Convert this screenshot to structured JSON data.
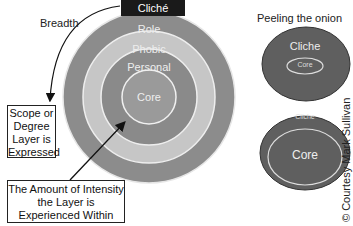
{
  "main_diagram": {
    "top_label": "Cliché",
    "breadth_label": "Breadth",
    "layers": [
      "Role",
      "Phobic",
      "Personal",
      "Core"
    ],
    "scope_box": [
      "Scope or",
      "Degree",
      "Layer is",
      "Expressed"
    ],
    "intensity_box": [
      "The Amount of Intensity",
      "the Layer is",
      "Experienced Within"
    ]
  },
  "onion": {
    "title": "Peeling the onion",
    "top": {
      "outer": "Cliche",
      "inner": "Core"
    },
    "bottom": {
      "outer": "Cliche",
      "inner": "Core"
    }
  },
  "credit": "© Courtesy Mark Sullivan",
  "colors": {
    "ring_dark": "#8a8a8a",
    "ring_light": "#c4c4c4",
    "onion_fill": "#5e5e5e",
    "label_box": "#1a1a1a"
  }
}
